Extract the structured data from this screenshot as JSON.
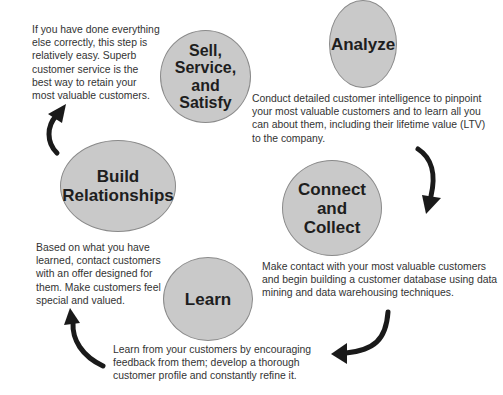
{
  "diagram": {
    "type": "cycle",
    "colors": {
      "node_fill": "#c9c9c9",
      "node_border": "#8a8a8a",
      "arrow": "#1a1a1a",
      "text": "#333333"
    },
    "nodes": [
      {
        "id": "analyze",
        "title": "Analyze",
        "description": "Conduct detailed customer intelligence to pinpoint your most valuable customers and to learn all you can about them, including their lifetime value (LTV) to the company."
      },
      {
        "id": "connect",
        "title": "Connect\nand\nCollect",
        "description": "Make contact with your most valuable customers and begin building a customer database using data mining and data warehousing techniques."
      },
      {
        "id": "learn",
        "title": "Learn",
        "description": "Learn from your customers by encouraging feedback from them; develop a thorough customer profile and constantly refine it."
      },
      {
        "id": "build",
        "title": "Build\nRelationships",
        "description": "Based on what you have learned, contact customers with an offer designed for them. Make customers feel special and valued."
      },
      {
        "id": "sell",
        "title": "Sell,\nService,\nand\nSatisfy",
        "description": "If you have done everything else correctly, this step is relatively easy. Superb customer service is the best way to retain your most valuable customers."
      }
    ],
    "edges": [
      {
        "from": "analyze",
        "to": "connect"
      },
      {
        "from": "connect",
        "to": "learn"
      },
      {
        "from": "learn",
        "to": "build"
      },
      {
        "from": "build",
        "to": "sell"
      }
    ]
  }
}
